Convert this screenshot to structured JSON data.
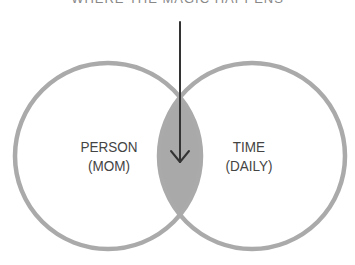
{
  "title": "WHERE THE MAGIC HAPPENS",
  "circles": [
    {
      "line1": "PERSON",
      "line2": "(MOM)"
    },
    {
      "line1": "TIME",
      "line2": "(DAILY)"
    }
  ],
  "colors": {
    "circle_stroke": "#aaaaaa",
    "intersection_fill": "#a9a9a9",
    "arrow": "#333333",
    "text": "#444444"
  }
}
